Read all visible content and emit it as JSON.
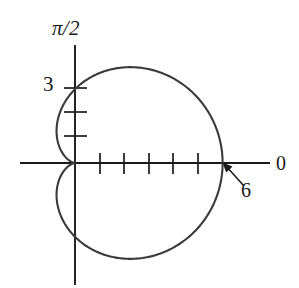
{
  "figure": {
    "title": "",
    "background_color": "#ffffff",
    "curve_color": "#3a3a3a",
    "axis_color": "#1a1a1a",
    "text_color": "#1a1a1a"
  },
  "labels": {
    "vertical_axis": "π/2",
    "horizontal_axis": "0",
    "radius_tick_label": "3",
    "max_radius_callout": "6"
  },
  "annotation": {
    "arrow_label": "6",
    "arrow_points_to": "curve-intersection-positive-x-axis",
    "arrow_tail_x": 244,
    "arrow_tail_y": 186,
    "arrow_head_x": 224,
    "arrow_head_y": 164
  },
  "chart_data": {
    "type": "line",
    "plot_kind": "polar",
    "curve_name": "cardioid",
    "equation": "r = 3(1 + cos θ)",
    "title": "",
    "xlabel": "0",
    "ylabel": "π/2",
    "grid": false,
    "legend": null,
    "theta_units": "radians",
    "theta_range": [
      0,
      6.283185307179586
    ],
    "r_max": 6,
    "r_at_theta_0": 6,
    "r_at_theta_pi_over_2": 3,
    "r_at_theta_pi": 0,
    "pixels_per_unit": 24.6,
    "origin_px": [
      75,
      163
    ],
    "axes": {
      "horizontal_axis_y_px": 163,
      "horizontal_axis_x_start_px": 20,
      "horizontal_axis_x_end_px": 270,
      "vertical_axis_x_px": 75,
      "vertical_axis_y_start_px": 45,
      "vertical_axis_y_end_px": 285
    },
    "ticks": {
      "vertical_axis_values": [
        1,
        2,
        3
      ],
      "vertical_axis_labels": [
        "",
        "",
        "3"
      ],
      "vertical_axis_y_px": [
        136,
        112,
        88
      ],
      "horizontal_axis_values": [
        1,
        2,
        3,
        4,
        5
      ],
      "horizontal_axis_labels": [
        "",
        "",
        "",
        "",
        ""
      ],
      "horizontal_axis_x_px": [
        100,
        124,
        149,
        173,
        198
      ]
    },
    "key_points": [
      {
        "theta": 0,
        "r": 6,
        "note": "rightmost point, labeled 6"
      },
      {
        "theta": 1.5707963,
        "r": 3,
        "note": "top intercept on pi/2 axis, labeled 3"
      },
      {
        "theta": 3.1415927,
        "r": 0,
        "note": "cusp at origin"
      },
      {
        "theta": 4.712389,
        "r": 3,
        "note": "bottom intercept on pi/2 axis"
      }
    ],
    "extents_px": {
      "top_y": 58,
      "bottom_y": 268,
      "left_x": 56,
      "right_x": 223
    }
  }
}
